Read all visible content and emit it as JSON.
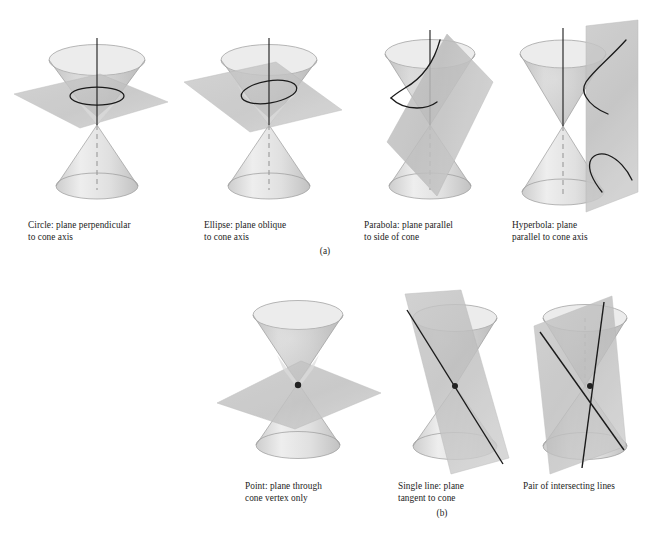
{
  "figure": {
    "row_labels": {
      "a": "(a)",
      "b": "(b)"
    },
    "colors": {
      "background": "#ffffff",
      "cone_light": "#e9e9e9",
      "cone_mid": "#d0d0d0",
      "cone_dark": "#b4b4b4",
      "cone_outline": "#8d8d8d",
      "plane_fill": "#bdbdbd",
      "plane_fill_light": "#d4d4d4",
      "curve_stroke": "#1a1a1a",
      "axis_stroke": "#1a1a1a",
      "vertex_dot": "#222222",
      "caption_text": "#1c1c1c"
    },
    "row_a": {
      "label": "(a)",
      "panels": [
        {
          "id": "circle",
          "name": "Circle",
          "caption": "Circle: plane perpendicular\nto cone axis",
          "caption_line1": "Circle: plane perpendicular",
          "caption_line2": "to cone axis",
          "plane_orientation": "perpendicular to axis",
          "section_curve": "circle",
          "has_axis_line": true,
          "has_dashed_axis": true
        },
        {
          "id": "ellipse",
          "name": "Ellipse",
          "caption": "Ellipse: plane oblique\nto cone axis",
          "caption_line1": "Ellipse: plane oblique",
          "caption_line2": "to cone axis",
          "plane_orientation": "oblique to axis",
          "section_curve": "ellipse",
          "has_axis_line": true,
          "has_dashed_axis": true
        },
        {
          "id": "parabola",
          "name": "Parabola",
          "caption": "Parabola: plane parallel\nto side of cone",
          "caption_line1": "Parabola: plane parallel",
          "caption_line2": "to side of cone",
          "plane_orientation": "parallel to side of cone",
          "section_curve": "parabola",
          "has_axis_line": true,
          "has_dashed_axis": true
        },
        {
          "id": "hyperbola",
          "name": "Hyperbola",
          "caption": "Hyperbola: plane\nparallel to cone axis",
          "caption_line1": "Hyperbola: plane",
          "caption_line2": "parallel to cone axis",
          "plane_orientation": "parallel to cone axis",
          "section_curve": "hyperbola (two branches)",
          "has_axis_line": true,
          "has_dashed_axis": true
        }
      ]
    },
    "row_b": {
      "label": "(b)",
      "panels": [
        {
          "id": "point",
          "name": "Point",
          "caption": "Point: plane through\ncone vertex only",
          "caption_line1": "Point: plane through",
          "caption_line2": "cone vertex only",
          "plane_orientation": "through vertex only",
          "section_curve": "point",
          "has_vertex_dot": true
        },
        {
          "id": "single-line",
          "name": "Single line",
          "caption": "Single line: plane\ntangent to cone",
          "caption_line1": "Single line: plane",
          "caption_line2": "tangent to cone",
          "plane_orientation": "tangent to cone",
          "section_curve": "single line",
          "has_vertex_dot": true
        },
        {
          "id": "intersecting-lines",
          "name": "Pair of intersecting lines",
          "caption": "Pair of intersecting lines",
          "caption_line1": "Pair of intersecting lines",
          "caption_line2": "",
          "plane_orientation": "through vertex cutting both nappes",
          "section_curve": "two intersecting lines",
          "has_vertex_dot": true
        }
      ]
    }
  }
}
